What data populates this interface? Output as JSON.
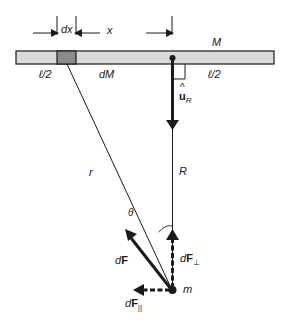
{
  "figure": {
    "labels": {
      "dx": "dx",
      "x": "x",
      "M": "M",
      "half_length_left": "ℓ/2",
      "half_length_right": "ℓ/2",
      "dM": "dM",
      "unit_vector_hat": "^",
      "unit_vector": "u",
      "unit_vector_sub": "R",
      "r": "r",
      "R": "R",
      "theta": "θ",
      "dF_d": "d",
      "dF_F": "F",
      "dFperp_d": "d",
      "dFperp_F": "F",
      "dFperp_sub": "⊥",
      "dFpar_d": "d",
      "dFpar_F": "F",
      "dFpar_sub": "||",
      "m": "m"
    },
    "colors": {
      "rod_fill": "#d9d9d9",
      "element_fill": "#8a8a8a",
      "stroke": "#1a1a1a",
      "background": "#ffffff"
    }
  }
}
